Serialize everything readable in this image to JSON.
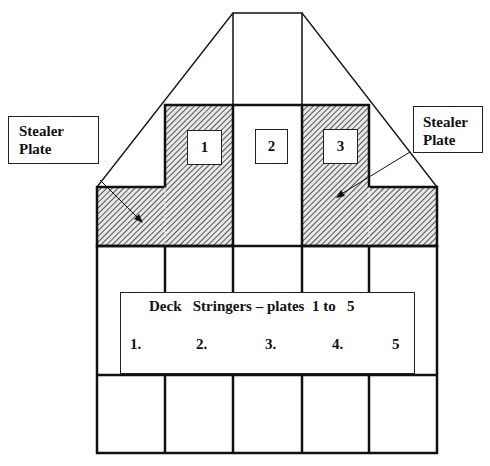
{
  "header_fragment": "...ppng,",
  "callouts": {
    "left": {
      "line1": "Stealer",
      "line2": "Plate"
    },
    "right": {
      "line1": "Stealer",
      "line2": "Plate"
    }
  },
  "plate_numbers": [
    "1",
    "2",
    "3"
  ],
  "stringer_box": {
    "title": "Deck   Stringers – plates  1 to   5",
    "numbers": [
      "1.",
      "2.",
      "3.",
      "4.",
      "5"
    ]
  },
  "colors": {
    "line": "#111111",
    "hatch": "#555555",
    "background": "#ffffff"
  }
}
